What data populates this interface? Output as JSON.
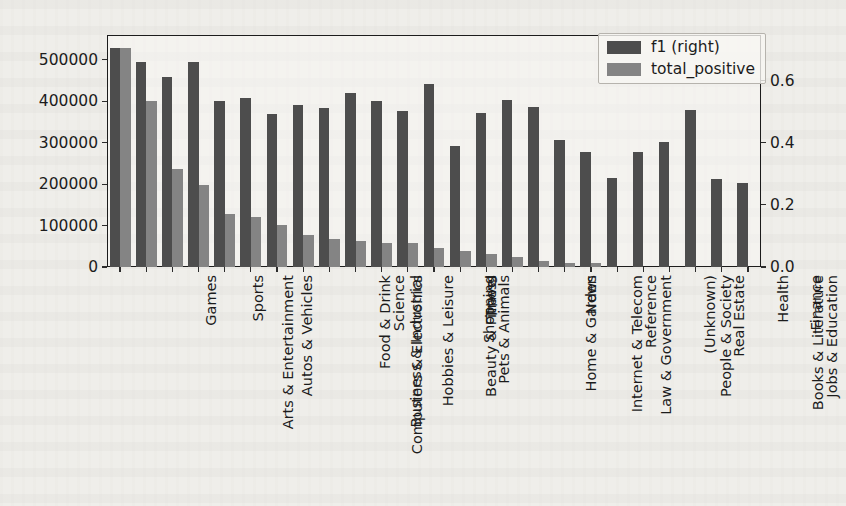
{
  "chart_data": {
    "type": "bar",
    "title": "",
    "xlabel": "",
    "ylabel": "",
    "ylabel_right": "",
    "grid": false,
    "legend_position": "upper right",
    "categories": [
      "Arts & Entertainment",
      "Games",
      "Autos & Vehicles",
      "Sports",
      "Computers & Electronics",
      "Business & Industrial",
      "Food & Drink",
      "Hobbies & Leisure",
      "Science",
      "Beauty & Fitness",
      "Pets & Animals",
      "Shopping",
      "Travel",
      "Home & Garden",
      "Internet & Telecom",
      "Law & Government",
      "News",
      "Reference",
      "People & Society",
      "(Unknown)",
      "Real Estate",
      "Books & Literature",
      "Jobs & Education",
      "Health",
      "Finance"
    ],
    "series": [
      {
        "name": "f1 (right)",
        "axis": "right",
        "color": "#4d4d4d",
        "values": [
          0.706,
          0.661,
          0.613,
          0.659,
          0.535,
          0.543,
          0.492,
          0.522,
          0.511,
          0.561,
          0.535,
          0.503,
          0.588,
          0.391,
          0.497,
          0.539,
          0.516,
          0.409,
          0.369,
          0.287,
          0.369,
          0.403,
          0.505,
          0.283,
          0.269
        ]
      },
      {
        "name": "total_positive",
        "axis": "left",
        "color": "#848484",
        "values": [
          529000,
          400000,
          236000,
          199000,
          127000,
          120000,
          102000,
          78000,
          67000,
          64000,
          59000,
          58000,
          47000,
          38000,
          31000,
          25000,
          14000,
          10000,
          9000,
          0,
          0,
          0,
          0,
          0,
          0
        ]
      }
    ],
    "left_axis": {
      "ticks": [
        "0",
        "100000",
        "200000",
        "300000",
        "400000",
        "500000"
      ],
      "values": [
        0,
        100000,
        200000,
        300000,
        400000,
        500000
      ],
      "lim": [
        0,
        560000
      ]
    },
    "right_axis": {
      "ticks": [
        "0.0",
        "0.2",
        "0.4",
        "0.6"
      ],
      "values": [
        0.0,
        0.2,
        0.4,
        0.6
      ],
      "lim": [
        0.0,
        0.7467
      ]
    }
  },
  "legend": {
    "entries": [
      {
        "label": "f1 (right)",
        "color": "#4d4d4d"
      },
      {
        "label": "total_positive",
        "color": "#848484"
      }
    ]
  }
}
